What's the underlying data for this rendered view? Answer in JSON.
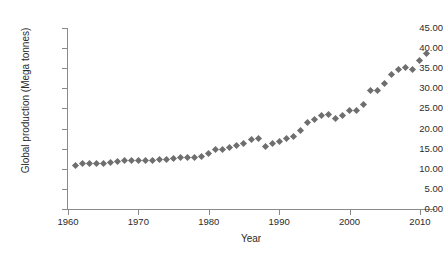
{
  "chart_data": {
    "type": "scatter",
    "title": "",
    "xlabel": "Year",
    "ylabel": "Global production (Mega tonnes)",
    "xlim": [
      1960,
      2012
    ],
    "ylim": [
      0.0,
      45.0
    ],
    "grid": false,
    "legend": null,
    "marker": "diamond",
    "marker_color": "#6e6e6e",
    "axis_color": "#8a8a8a",
    "x_ticks": [
      1960,
      1970,
      1980,
      1990,
      2000,
      2010
    ],
    "x_tick_labels": [
      "1960",
      "1970",
      "1980",
      "1990",
      "2000",
      "2010"
    ],
    "y_ticks": [
      0.0,
      5.0,
      10.0,
      15.0,
      20.0,
      25.0,
      30.0,
      35.0,
      40.0,
      45.0
    ],
    "y_tick_labels": [
      "0.00",
      "5.00",
      "10.00",
      "15.00",
      "20.00",
      "25.00",
      "30.00",
      "35.00",
      "40.00",
      "45.00"
    ],
    "x": [
      1961,
      1962,
      1963,
      1964,
      1965,
      1966,
      1967,
      1968,
      1969,
      1970,
      1971,
      1972,
      1973,
      1974,
      1975,
      1976,
      1977,
      1978,
      1979,
      1980,
      1981,
      1982,
      1983,
      1984,
      1985,
      1986,
      1987,
      1988,
      1989,
      1990,
      1991,
      1992,
      1993,
      1994,
      1995,
      1996,
      1997,
      1998,
      1999,
      2000,
      2001,
      2002,
      2003,
      2004,
      2005,
      2006,
      2007,
      2008,
      2009,
      2010,
      2011
    ],
    "values": [
      10.9,
      11.2,
      11.2,
      11.3,
      11.4,
      11.6,
      11.7,
      12.0,
      12.0,
      12.0,
      12.1,
      12.1,
      12.2,
      12.3,
      12.6,
      12.7,
      12.8,
      12.9,
      13.1,
      13.9,
      14.9,
      14.9,
      15.2,
      15.7,
      16.4,
      17.2,
      17.5,
      15.5,
      16.3,
      16.9,
      17.6,
      18.0,
      19.4,
      21.5,
      22.3,
      23.2,
      23.4,
      22.4,
      23.2,
      24.4,
      24.6,
      25.9,
      29.4,
      29.4,
      31.3,
      33.5,
      34.6,
      35.3,
      34.6,
      36.9,
      38.7
    ],
    "series_name": "Global production"
  },
  "axes": {
    "x_title": "Year",
    "y_title": "Global production (Mega tonnes)"
  }
}
